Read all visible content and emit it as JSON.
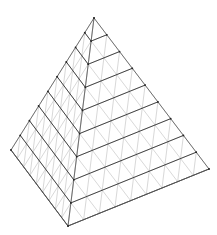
{
  "diagram": {
    "type": "subdivided-tetrahedron-wireframe",
    "subdivisions": 9,
    "vertices": {
      "apex": [
        94,
        18
      ],
      "left": [
        11,
        150
      ],
      "front": [
        68,
        226
      ],
      "right": [
        209,
        169
      ]
    },
    "colors": {
      "background": "#ffffff",
      "outline": "#555555",
      "slice": "#333333",
      "mesh": "#bdbdbd",
      "node": "#222222"
    }
  }
}
